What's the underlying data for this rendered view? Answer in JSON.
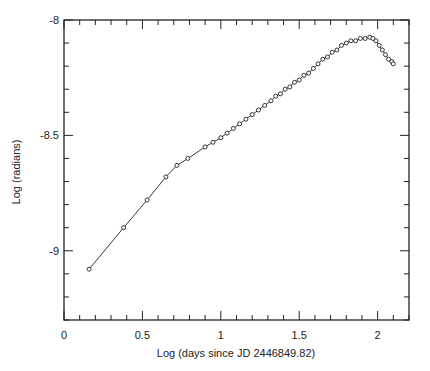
{
  "chart_data": {
    "type": "line",
    "title": "",
    "xlabel": "Log (days since JD 2446849.82)",
    "ylabel": "Log (radians)",
    "xlim": [
      0,
      2.2
    ],
    "ylim": [
      -9.3,
      -8.0
    ],
    "xticks": [
      0,
      0.5,
      1,
      1.5,
      2
    ],
    "xtick_labels": [
      "0",
      "0.5",
      "1",
      "1.5",
      "2"
    ],
    "yticks": [
      -8,
      -8.5,
      -9
    ],
    "ytick_labels": [
      "-8",
      "-8.5",
      "-9"
    ],
    "grid": false,
    "legend": null,
    "marker": "open-circle",
    "series": [
      {
        "name": "angular size",
        "x": [
          0.16,
          0.38,
          0.53,
          0.65,
          0.72,
          0.79,
          0.9,
          0.95,
          1.0,
          1.04,
          1.08,
          1.12,
          1.16,
          1.2,
          1.24,
          1.28,
          1.32,
          1.35,
          1.38,
          1.41,
          1.44,
          1.47,
          1.5,
          1.53,
          1.56,
          1.59,
          1.62,
          1.65,
          1.68,
          1.71,
          1.74,
          1.77,
          1.8,
          1.83,
          1.86,
          1.89,
          1.92,
          1.95,
          1.97,
          1.99,
          2.01,
          2.03,
          2.05,
          2.07,
          2.09,
          2.1
        ],
        "y": [
          -9.08,
          -8.9,
          -8.78,
          -8.68,
          -8.63,
          -8.6,
          -8.55,
          -8.53,
          -8.51,
          -8.49,
          -8.47,
          -8.45,
          -8.43,
          -8.41,
          -8.39,
          -8.37,
          -8.35,
          -8.33,
          -8.32,
          -8.3,
          -8.29,
          -8.27,
          -8.26,
          -8.24,
          -8.23,
          -8.21,
          -8.19,
          -8.17,
          -8.16,
          -8.14,
          -8.13,
          -8.11,
          -8.1,
          -8.09,
          -8.09,
          -8.08,
          -8.08,
          -8.075,
          -8.08,
          -8.09,
          -8.11,
          -8.13,
          -8.15,
          -8.17,
          -8.18,
          -8.19
        ]
      }
    ]
  }
}
